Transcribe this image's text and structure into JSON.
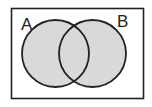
{
  "diagram": {
    "type": "venn",
    "shaded_region": "A union B",
    "sets": [
      {
        "label": "A",
        "cx": 55.5,
        "cy": 53.5,
        "r": 33.5
      },
      {
        "label": "B",
        "cx": 92.5,
        "cy": 53.5,
        "r": 33.5
      }
    ],
    "colors": {
      "fill": "#d9d9d9",
      "stroke": "#222222",
      "background": "#ffffff"
    }
  }
}
